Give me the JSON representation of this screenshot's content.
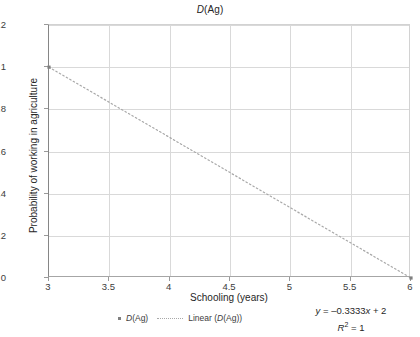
{
  "chart_data": {
    "type": "scatter",
    "title": "D(Ag)",
    "xlabel": "Schooling (years)",
    "ylabel": "Probability of working in agriculture",
    "xlim": [
      3,
      6
    ],
    "ylim": [
      0,
      1.2
    ],
    "xticks": [
      "3",
      "3.5",
      "4",
      "4.5",
      "5",
      "5.5",
      "6"
    ],
    "xtick_values": [
      3,
      3.5,
      4,
      4.5,
      5,
      5.5,
      6
    ],
    "yticks": [
      "0",
      "0.2",
      "0.4",
      "0.6",
      "0.8",
      "1",
      "1.2"
    ],
    "ytick_values": [
      0,
      0.2,
      0.4,
      0.6,
      0.8,
      1,
      1.2
    ],
    "grid": true,
    "legend_position": "bottom",
    "series": [
      {
        "name": "D(Ag)",
        "type": "scatter",
        "marker": "square",
        "color": "#808080",
        "x": [
          3,
          6
        ],
        "y": [
          1,
          0
        ]
      },
      {
        "name": "Linear (D(Ag))",
        "type": "line",
        "style": "dotted",
        "color": "#a8a8a8",
        "x": [
          3,
          6
        ],
        "y": [
          1,
          0
        ]
      }
    ],
    "annotations": {
      "equation": "y = –0.3333x + 2",
      "equation_parts": {
        "y_symbol": "y",
        "equals": " = ",
        "slope": "–0.3333",
        "x_symbol": "x",
        "plus_intercept": " + 2"
      },
      "r_squared_symbol": "R",
      "r_squared_exponent": "2",
      "r_squared_value": " = 1",
      "r_squared_full": "R2 = 1"
    },
    "colors": {
      "background": "#ffffff",
      "gridline": "#d9d9d9",
      "axis": "#868686",
      "marker": "#808080",
      "trendline": "#a8a8a8",
      "text": "#262626"
    }
  },
  "legend": {
    "entries": [
      {
        "label": "D(Ag)",
        "marker": "square-point"
      },
      {
        "label": "Linear (D(Ag))",
        "marker": "dotted-line"
      }
    ]
  }
}
